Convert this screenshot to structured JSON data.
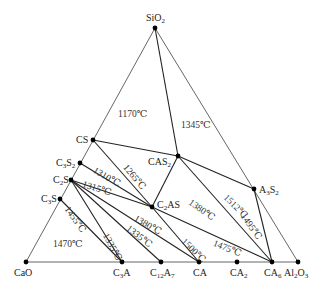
{
  "diagram": {
    "type": "ternary-phase-diagram",
    "vertices": [
      {
        "id": "SiO2",
        "label": "SiO2",
        "x": 155,
        "y": 28
      },
      {
        "id": "CaO",
        "label": "CaO",
        "x": 26,
        "y": 262
      },
      {
        "id": "Al2O3",
        "label": "Al2O3",
        "x": 298,
        "y": 262
      }
    ],
    "compounds": [
      {
        "id": "CS",
        "label": "CS",
        "x": 93,
        "y": 140
      },
      {
        "id": "C3S2",
        "label": "C3S2",
        "x": 80,
        "y": 163
      },
      {
        "id": "C2S",
        "label": "C2S",
        "x": 71,
        "y": 180
      },
      {
        "id": "C3S",
        "label": "C3S",
        "x": 60,
        "y": 199
      },
      {
        "id": "CAS2",
        "label": "CAS2",
        "x": 178,
        "y": 156
      },
      {
        "id": "C2AS",
        "label": "C2AS",
        "x": 152,
        "y": 207
      },
      {
        "id": "A3S2",
        "label": "A3S2",
        "x": 254,
        "y": 189
      },
      {
        "id": "C3A",
        "label": "C3A",
        "x": 122,
        "y": 262
      },
      {
        "id": "C12A7",
        "label": "C12A7",
        "x": 161,
        "y": 262
      },
      {
        "id": "CA",
        "label": "CA",
        "x": 199,
        "y": 262
      },
      {
        "id": "CA2",
        "label": "CA2",
        "x": 237,
        "y": 262
      },
      {
        "id": "CA6",
        "label": "CA6",
        "x": 272,
        "y": 262
      }
    ],
    "tie_lines": [
      [
        "SiO2",
        "CAS2"
      ],
      [
        "CS",
        "CAS2"
      ],
      [
        "CS",
        "C2AS"
      ],
      [
        "C3S2",
        "C2AS"
      ],
      [
        "C2S",
        "C2AS"
      ],
      [
        "CAS2",
        "C2AS"
      ],
      [
        "CAS2",
        "A3S2"
      ],
      [
        "CAS2",
        "CA6"
      ],
      [
        "A3S2",
        "CA6"
      ],
      [
        "C2AS",
        "CA"
      ],
      [
        "C2AS",
        "CA6"
      ],
      [
        "C2S",
        "CA"
      ],
      [
        "C2S",
        "C12A7"
      ],
      [
        "C2S",
        "C3A"
      ],
      [
        "C3S",
        "C3A"
      ]
    ],
    "temperatures": [
      {
        "text": "1170℃",
        "x": 118,
        "y": 110,
        "rot": 0
      },
      {
        "text": "1345℃",
        "x": 181,
        "y": 121,
        "rot": 0
      },
      {
        "text": "1265℃",
        "x": 128,
        "y": 163,
        "rot": 50
      },
      {
        "text": "1310℃",
        "x": 96,
        "y": 166,
        "rot": 30
      },
      {
        "text": "1315℃",
        "x": 84,
        "y": 180,
        "rot": 18
      },
      {
        "text": "1380℃",
        "x": 192,
        "y": 198,
        "rot": 35
      },
      {
        "text": "1512℃",
        "x": 228,
        "y": 193,
        "rot": 45
      },
      {
        "text": "1495℃",
        "x": 246,
        "y": 212,
        "rot": 55
      },
      {
        "text": "1455℃",
        "x": 70,
        "y": 205,
        "rot": 55
      },
      {
        "text": "1470℃",
        "x": 53,
        "y": 240,
        "rot": 0
      },
      {
        "text": "1335℃",
        "x": 109,
        "y": 232,
        "rot": 62
      },
      {
        "text": "1335℃",
        "x": 130,
        "y": 224,
        "rot": 38
      },
      {
        "text": "1380℃",
        "x": 137,
        "y": 214,
        "rot": 30
      },
      {
        "text": "1500℃",
        "x": 186,
        "y": 237,
        "rot": 45
      },
      {
        "text": "1475℃",
        "x": 215,
        "y": 239,
        "rot": 22
      }
    ]
  }
}
